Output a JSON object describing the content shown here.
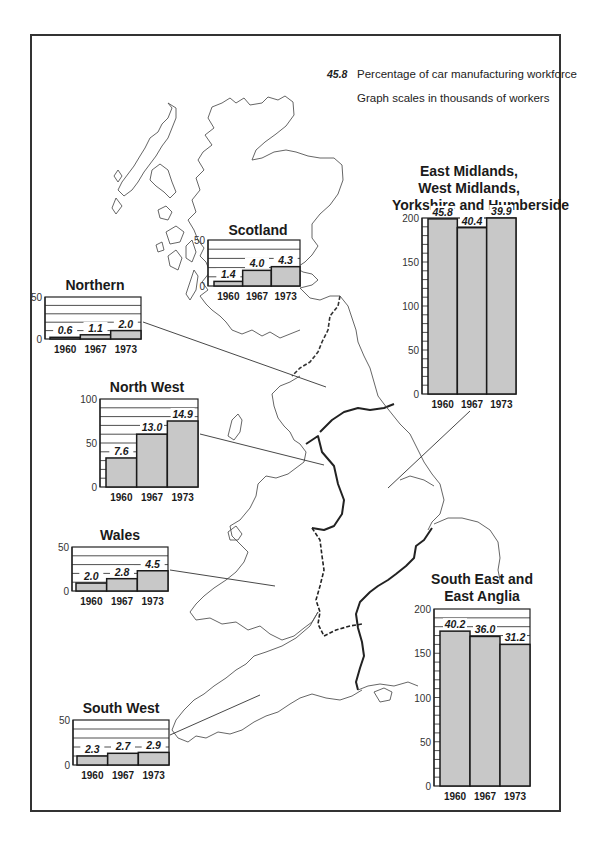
{
  "legend": {
    "sample_value": "45.8",
    "percentage_label": "Percentage of car manufacturing workforce",
    "scale_note": "Graph scales in thousands of workers"
  },
  "colors": {
    "bar_fill": "#c8c8c8",
    "bar_stroke": "#1a1a1a",
    "map_line": "#444444",
    "frame": "#333333"
  },
  "chart_data": [
    {
      "type": "bar",
      "title": "Scotland",
      "categories": [
        "1960",
        "1967",
        "1973"
      ],
      "values": [
        5,
        17,
        21
      ],
      "percent_labels": [
        "1.4",
        "4.0",
        "4.3"
      ],
      "ylim": [
        0,
        50
      ],
      "yticks": [
        0,
        50
      ],
      "ylabel": "thousands of workers"
    },
    {
      "type": "bar",
      "title": "Northern",
      "categories": [
        "1960",
        "1967",
        "1973"
      ],
      "values": [
        2,
        5,
        10
      ],
      "percent_labels": [
        "0.6",
        "1.1",
        "2.0"
      ],
      "ylim": [
        0,
        50
      ],
      "yticks": [
        0,
        50
      ],
      "ylabel": "thousands of workers"
    },
    {
      "type": "bar",
      "title": "North West",
      "categories": [
        "1960",
        "1967",
        "1973"
      ],
      "values": [
        33,
        60,
        75
      ],
      "percent_labels": [
        "7.6",
        "13.0",
        "14.9"
      ],
      "ylim": [
        0,
        100
      ],
      "yticks": [
        0,
        50,
        100
      ],
      "ylabel": "thousands of workers"
    },
    {
      "type": "bar",
      "title": "Wales",
      "categories": [
        "1960",
        "1967",
        "1973"
      ],
      "values": [
        9,
        14,
        23
      ],
      "percent_labels": [
        "2.0",
        "2.8",
        "4.5"
      ],
      "ylim": [
        0,
        50
      ],
      "yticks": [
        0,
        50
      ],
      "ylabel": "thousands of workers"
    },
    {
      "type": "bar",
      "title": "South West",
      "categories": [
        "1960",
        "1967",
        "1973"
      ],
      "values": [
        10,
        13,
        14
      ],
      "percent_labels": [
        "2.3",
        "2.7",
        "2.9"
      ],
      "ylim": [
        0,
        50
      ],
      "yticks": [
        0,
        50
      ],
      "ylabel": "thousands of workers"
    },
    {
      "type": "bar",
      "title": "East Midlands, West Midlands, Yorkshire and Humberside",
      "title_lines": [
        "East Midlands,",
        "West Midlands,",
        "Yorkshire and Humberside"
      ],
      "categories": [
        "1960",
        "1967",
        "1973"
      ],
      "values": [
        199,
        189,
        200
      ],
      "percent_labels": [
        "45.8",
        "40.4",
        "39.9"
      ],
      "ylim": [
        0,
        200
      ],
      "yticks": [
        0,
        50,
        100,
        150,
        200
      ],
      "ylabel": "thousands of workers"
    },
    {
      "type": "bar",
      "title": "South East and East Anglia",
      "title_lines": [
        "South East and",
        "East Anglia"
      ],
      "categories": [
        "1960",
        "1967",
        "1973"
      ],
      "values": [
        175,
        169,
        160
      ],
      "percent_labels": [
        "40.2",
        "36.0",
        "31.2"
      ],
      "ylim": [
        0,
        200
      ],
      "yticks": [
        0,
        50,
        100,
        150,
        200
      ],
      "ylabel": "thousands of workers"
    }
  ],
  "layout": {
    "charts": [
      {
        "left": 208,
        "top": 240,
        "w": 92,
        "h": 46,
        "titleX": 0,
        "titleY": -18,
        "titleW": 100,
        "scaleStep": 10,
        "barStart": 6,
        "barW": 28,
        "gap": 0
      },
      {
        "left": 45,
        "top": 297,
        "w": 96,
        "h": 42,
        "titleX": 0,
        "titleY": -20,
        "titleW": 100,
        "scaleStep": 10,
        "barStart": 5,
        "barW": 29,
        "gap": 0
      },
      {
        "left": 100,
        "top": 399,
        "w": 98,
        "h": 88,
        "titleX": -8,
        "titleY": -20,
        "titleW": 110,
        "scaleStep": 10,
        "barStart": 6,
        "barW": 29,
        "gap": 0
      },
      {
        "left": 72,
        "top": 547,
        "w": 96,
        "h": 44,
        "titleX": 0,
        "titleY": -20,
        "titleW": 96,
        "scaleStep": 10,
        "barStart": 4,
        "barW": 29,
        "gap": 0
      },
      {
        "left": 73,
        "top": 720,
        "w": 96,
        "h": 45,
        "titleX": 0,
        "titleY": -20,
        "titleW": 96,
        "scaleStep": 10,
        "barStart": 4,
        "barW": 29,
        "gap": 0
      },
      {
        "left": 422,
        "top": 218,
        "w": 94,
        "h": 176,
        "titleX": -30,
        "titleY": -70,
        "titleW": 154,
        "scaleStep": 10,
        "barStart": 6,
        "barW": 28,
        "gap": 0
      },
      {
        "left": 434,
        "top": 609,
        "w": 96,
        "h": 177,
        "titleX": -14,
        "titleY": -40,
        "titleW": 124,
        "scaleStep": 10,
        "barStart": 6,
        "barW": 28,
        "gap": 0
      }
    ]
  }
}
